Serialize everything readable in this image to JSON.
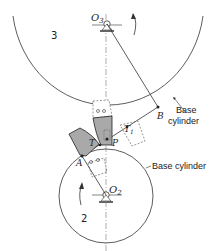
{
  "figure": {
    "gear_upper": {
      "number": "3",
      "center_label": "O",
      "center_subscript": "3",
      "base_label_line1": "Base",
      "base_label_line2": "cylinder"
    },
    "gear_lower": {
      "number": "2",
      "center_label": "O",
      "center_subscript": "2",
      "base_label": "Base cylinder"
    },
    "points": {
      "A": "A",
      "B": "B",
      "P": "P",
      "T": "T",
      "T1_main": "T",
      "T1_sub": "1"
    },
    "colors": {
      "line": "#333333",
      "tooth_fill": "#a9a9a9",
      "dashed": "#555555"
    }
  }
}
